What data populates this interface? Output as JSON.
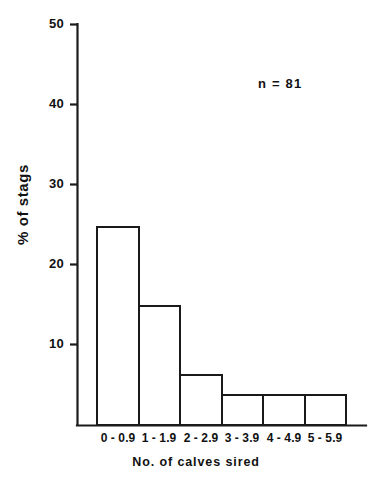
{
  "chart_data": {
    "type": "bar",
    "title": "",
    "subtitle": "",
    "xlabel": "No. of calves sired",
    "ylabel": "% of stags",
    "categories": [
      "0 - 0.9",
      "1 - 1.9",
      "2 - 2.9",
      "3 - 3.9",
      "4 - 4.9",
      "5 - 5.9"
    ],
    "values": [
      46.9,
      24.7,
      14.8,
      6.2,
      3.7,
      3.7
    ],
    "ylim": [
      0,
      50
    ],
    "yticks": [
      10,
      20,
      30,
      40,
      50
    ],
    "ytick_labels": [
      "10",
      "20",
      "30",
      "40",
      "50"
    ],
    "grid": false,
    "legend": null,
    "annotations": [
      {
        "text": "n = 81",
        "x": 258,
        "y": 76
      }
    ],
    "bar_fill": "#ffffff",
    "bar_edge": "#1a1a1a",
    "axis_color": "#1a1a1a",
    "background": "#ffffff"
  },
  "axis": {
    "y_label": "% of stags",
    "x_title": "No. of calves sired",
    "ticks_y": [
      "50",
      "40",
      "30",
      "20",
      "10"
    ]
  },
  "annotation": {
    "sample_size": "n = 81"
  },
  "ticks_x": [
    {
      "label": "0 - 0.9"
    },
    {
      "label": "1 - 1.9"
    },
    {
      "label": "2 - 2.9"
    },
    {
      "label": "3 - 3.9"
    },
    {
      "label": "4 - 4.9"
    },
    {
      "label": "5 - 5.9"
    }
  ]
}
